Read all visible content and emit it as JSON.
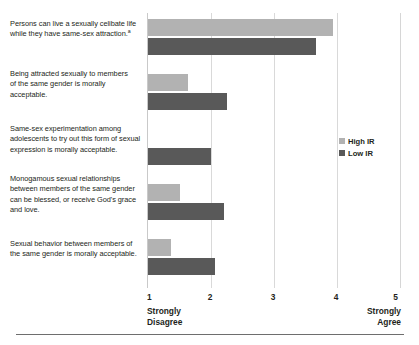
{
  "chart_data": {
    "type": "bar",
    "orientation": "horizontal",
    "title": "",
    "xlabel": "",
    "ylabel": "",
    "xlim": [
      1,
      5
    ],
    "xticks": [
      1,
      2,
      3,
      4,
      5
    ],
    "xtick_labels": [
      "1",
      "2",
      "3",
      "4",
      "5"
    ],
    "scale_low_label": "Strongly\nDisagree",
    "scale_high_label": "Strongly\nAgree",
    "grid": true,
    "grid_axis": "x",
    "legend_position": "right",
    "categories": [
      "Persons can live a sexually celibate life while they have same-sex attraction.",
      "Being attracted sexually to members of the same gender is morally acceptable.",
      "Same-sex experimentation among adolescents to try out this form of sexual expression is morally acceptable.",
      "Monogamous sexual relationships between members of the same gender can be blessed, or receive God's grace and love.",
      "Sexual behavior between members of the same gender is morally acceptable."
    ],
    "series": [
      {
        "name": "High IR",
        "color": "#b2b2b2",
        "values": [
          3.93,
          1.63,
          1.0,
          1.5,
          1.37
        ]
      },
      {
        "name": "Low IR",
        "color": "#595959",
        "values": [
          3.67,
          2.25,
          2.0,
          2.21,
          2.07
        ]
      }
    ]
  },
  "category_labels": [
    {
      "line1": "Persons can live a sexually celibate life",
      "line2": "while they have same-sex attraction.",
      "footnote_marker": "a"
    },
    {
      "line1": "Being attracted sexually to members",
      "line2": "of the same gender is morally",
      "line3": "acceptable.",
      "footnote_marker": ""
    },
    {
      "line1": "Same-sex experimentation among",
      "line2": "adolescents to try out this form of sexual",
      "line3": "expression is morally acceptable.",
      "footnote_marker": ""
    },
    {
      "line1": "Monogamous sexual relationships",
      "line2": "between members of the same gender",
      "line3": "can be blessed, or receive God's grace",
      "line4": "and love.",
      "footnote_marker": ""
    },
    {
      "line1": "Sexual behavior between members of",
      "line2": "the same gender is morally acceptable.",
      "footnote_marker": ""
    }
  ],
  "legend": {
    "items": [
      {
        "label": "High IR",
        "color": "#b2b2b2"
      },
      {
        "label": "Low IR",
        "color": "#595959"
      }
    ]
  },
  "axis": {
    "ticks": [
      "1",
      "2",
      "3",
      "4",
      "5"
    ],
    "low_anchor_line1": "Strongly",
    "low_anchor_line2": "Disagree",
    "high_anchor_line1": "Strongly",
    "high_anchor_line2": "Agree"
  },
  "colors": {
    "high_ir": "#b2b2b2",
    "low_ir": "#595959",
    "gridline": "#d9d9d9",
    "text": "#231f20",
    "background": "#ffffff"
  }
}
